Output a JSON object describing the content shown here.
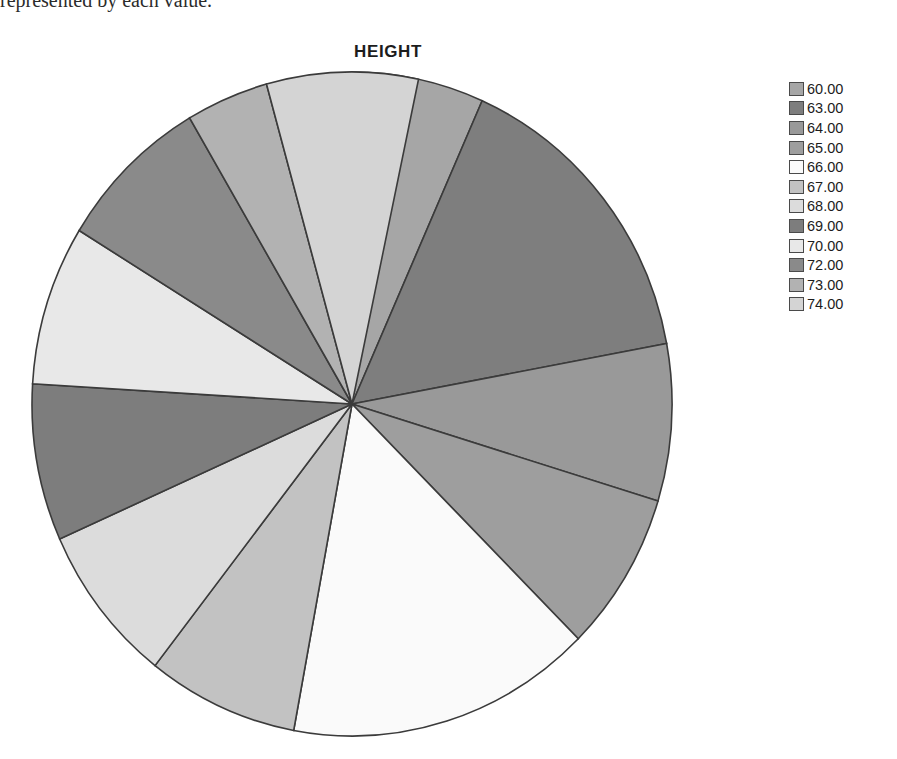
{
  "page": {
    "caption_fragment": "represented by each value."
  },
  "chart_data": {
    "type": "pie",
    "title": "HEIGHT",
    "xlabel": "",
    "ylabel": "",
    "legend_position": "right",
    "grid": false,
    "start_angle_deg": 0,
    "direction": "clockwise",
    "categories": [
      "60.00",
      "63.00",
      "64.00",
      "65.00",
      "66.00",
      "67.00",
      "68.00",
      "69.00",
      "70.00",
      "72.00",
      "73.00",
      "74.00"
    ],
    "values": [
      1,
      2,
      1,
      1,
      2,
      1,
      1,
      1,
      1,
      1,
      1,
      1
    ],
    "slice_angles_deg": [
      24.0,
      55.5,
      27.5,
      28.0,
      55.5,
      27.5,
      28.0,
      27.5,
      28.0,
      28.0,
      15.0,
      27.5
    ],
    "colors": [
      "#a6a6a6",
      "#7e7e7e",
      "#999999",
      "#9e9e9e",
      "#fafafa",
      "#c2c2c2",
      "#dcdcdc",
      "#7d7d7d",
      "#e8e8e8",
      "#8a8a8a",
      "#b2b2b2",
      "#d4d4d4"
    ],
    "slice_outline_color": "#3b3b3b",
    "legend": [
      {
        "label": "60.00",
        "color": "#a6a6a6"
      },
      {
        "label": "63.00",
        "color": "#7e7e7e"
      },
      {
        "label": "64.00",
        "color": "#999999"
      },
      {
        "label": "65.00",
        "color": "#9e9e9e"
      },
      {
        "label": "66.00",
        "color": "#fafafa"
      },
      {
        "label": "67.00",
        "color": "#c2c2c2"
      },
      {
        "label": "68.00",
        "color": "#dcdcdc"
      },
      {
        "label": "69.00",
        "color": "#7d7d7d"
      },
      {
        "label": "70.00",
        "color": "#e8e8e8"
      },
      {
        "label": "72.00",
        "color": "#8a8a8a"
      },
      {
        "label": "73.00",
        "color": "#b2b2b2"
      },
      {
        "label": "74.00",
        "color": "#d4d4d4"
      }
    ]
  },
  "geometry": {
    "center_x": 330,
    "center_y": 342,
    "radius_x": 320,
    "radius_y": 332
  }
}
